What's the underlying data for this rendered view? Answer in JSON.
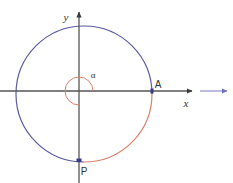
{
  "figure": {
    "background": "#ffffff",
    "width": 233,
    "height": 183
  },
  "colors": {
    "circle_major": "#5a5aa0",
    "circle_minor": "#d9806c",
    "axis": "#555555",
    "axis_extension": "#8f8fd0",
    "angle_arc": "#d9806c",
    "point_marker": "#3a3a8c",
    "text": "#333333"
  },
  "axes": {
    "x_label": "x",
    "y_label": "y",
    "origin": {
      "x": 79,
      "y": 91
    },
    "x_axis": {
      "x1": 0,
      "x2": 196,
      "y": 91,
      "arrow": "right"
    },
    "x_axis_extension": {
      "x1": 196,
      "x2": 231,
      "y": 91,
      "arrow": "right"
    },
    "y_axis": {
      "x": 79,
      "y1": 183,
      "y2": 8,
      "arrow": "up"
    }
  },
  "circle": {
    "center": {
      "x": 84,
      "y": 94
    },
    "radius": 68,
    "major_arc_color": "#5a5aa0",
    "minor_arc_color": "#d9806c",
    "major_arc_description": "counterclockwise from A around to P",
    "minor_arc_description": "clockwise from A down to P"
  },
  "angle": {
    "symbol": "α",
    "arc_radius": 14,
    "arc_start_deg": 0,
    "arc_sweep_deg": 270,
    "label_position": {
      "x": 93,
      "y": 78
    }
  },
  "points": [
    {
      "name": "A",
      "label": "A",
      "x": 152,
      "y": 91,
      "label_position": {
        "x": 158,
        "y": 88
      }
    },
    {
      "name": "P",
      "label": "P",
      "x": 79,
      "y": 160,
      "label_position": {
        "x": 84,
        "y": 175
      }
    }
  ]
}
